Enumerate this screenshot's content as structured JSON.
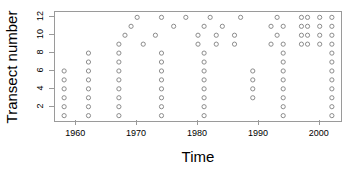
{
  "chart_data": {
    "type": "scatter",
    "title": "",
    "xlabel": "Time",
    "ylabel": "Transect number",
    "xlim": [
      1956.5,
      2003.5
    ],
    "ylim": [
      0.4,
      12.6
    ],
    "xticks": [
      1960,
      1970,
      1980,
      1990,
      2000
    ],
    "yticks": [
      2,
      4,
      6,
      8,
      10,
      12
    ],
    "grid": false,
    "legend": null,
    "marker": "open-circle",
    "marker_color": "#8c8c8c",
    "points": [
      {
        "x": 1958,
        "y": 1
      },
      {
        "x": 1958,
        "y": 2
      },
      {
        "x": 1958,
        "y": 3
      },
      {
        "x": 1958,
        "y": 4
      },
      {
        "x": 1958,
        "y": 5
      },
      {
        "x": 1958,
        "y": 6
      },
      {
        "x": 1962,
        "y": 1
      },
      {
        "x": 1962,
        "y": 2
      },
      {
        "x": 1962,
        "y": 3
      },
      {
        "x": 1962,
        "y": 4
      },
      {
        "x": 1962,
        "y": 5
      },
      {
        "x": 1962,
        "y": 6
      },
      {
        "x": 1962,
        "y": 7
      },
      {
        "x": 1962,
        "y": 8
      },
      {
        "x": 1967,
        "y": 1
      },
      {
        "x": 1967,
        "y": 2
      },
      {
        "x": 1967,
        "y": 3
      },
      {
        "x": 1967,
        "y": 4
      },
      {
        "x": 1967,
        "y": 5
      },
      {
        "x": 1967,
        "y": 6
      },
      {
        "x": 1967,
        "y": 7
      },
      {
        "x": 1967,
        "y": 8
      },
      {
        "x": 1967,
        "y": 9
      },
      {
        "x": 1968,
        "y": 10
      },
      {
        "x": 1969,
        "y": 11
      },
      {
        "x": 1970,
        "y": 12
      },
      {
        "x": 1971,
        "y": 9
      },
      {
        "x": 1973,
        "y": 10
      },
      {
        "x": 1974,
        "y": 1
      },
      {
        "x": 1974,
        "y": 2
      },
      {
        "x": 1974,
        "y": 3
      },
      {
        "x": 1974,
        "y": 4
      },
      {
        "x": 1974,
        "y": 5
      },
      {
        "x": 1974,
        "y": 6
      },
      {
        "x": 1974,
        "y": 7
      },
      {
        "x": 1974,
        "y": 8
      },
      {
        "x": 1974,
        "y": 12
      },
      {
        "x": 1976,
        "y": 11
      },
      {
        "x": 1978,
        "y": 12
      },
      {
        "x": 1980,
        "y": 9
      },
      {
        "x": 1980,
        "y": 10
      },
      {
        "x": 1981,
        "y": 1
      },
      {
        "x": 1981,
        "y": 2
      },
      {
        "x": 1981,
        "y": 3
      },
      {
        "x": 1981,
        "y": 4
      },
      {
        "x": 1981,
        "y": 5
      },
      {
        "x": 1981,
        "y": 6
      },
      {
        "x": 1981,
        "y": 7
      },
      {
        "x": 1981,
        "y": 8
      },
      {
        "x": 1981,
        "y": 11
      },
      {
        "x": 1982,
        "y": 12
      },
      {
        "x": 1983,
        "y": 9
      },
      {
        "x": 1983,
        "y": 10
      },
      {
        "x": 1984,
        "y": 11
      },
      {
        "x": 1986,
        "y": 9
      },
      {
        "x": 1986,
        "y": 10
      },
      {
        "x": 1987,
        "y": 12
      },
      {
        "x": 1989,
        "y": 3
      },
      {
        "x": 1989,
        "y": 4
      },
      {
        "x": 1989,
        "y": 5
      },
      {
        "x": 1989,
        "y": 6
      },
      {
        "x": 1992,
        "y": 9
      },
      {
        "x": 1992,
        "y": 11
      },
      {
        "x": 1993,
        "y": 10
      },
      {
        "x": 1993,
        "y": 12
      },
      {
        "x": 1994,
        "y": 1
      },
      {
        "x": 1994,
        "y": 2
      },
      {
        "x": 1994,
        "y": 3
      },
      {
        "x": 1994,
        "y": 4
      },
      {
        "x": 1994,
        "y": 5
      },
      {
        "x": 1994,
        "y": 6
      },
      {
        "x": 1994,
        "y": 7
      },
      {
        "x": 1994,
        "y": 8
      },
      {
        "x": 1994,
        "y": 9
      },
      {
        "x": 1994,
        "y": 11
      },
      {
        "x": 1997,
        "y": 9
      },
      {
        "x": 1997,
        "y": 10
      },
      {
        "x": 1997,
        "y": 11
      },
      {
        "x": 1997,
        "y": 12
      },
      {
        "x": 1998,
        "y": 9
      },
      {
        "x": 1998,
        "y": 10
      },
      {
        "x": 1998,
        "y": 11
      },
      {
        "x": 1998,
        "y": 12
      },
      {
        "x": 2000,
        "y": 9
      },
      {
        "x": 2000,
        "y": 10
      },
      {
        "x": 2000,
        "y": 11
      },
      {
        "x": 2000,
        "y": 12
      },
      {
        "x": 2002,
        "y": 1
      },
      {
        "x": 2002,
        "y": 2
      },
      {
        "x": 2002,
        "y": 3
      },
      {
        "x": 2002,
        "y": 4
      },
      {
        "x": 2002,
        "y": 5
      },
      {
        "x": 2002,
        "y": 6
      },
      {
        "x": 2002,
        "y": 7
      },
      {
        "x": 2002,
        "y": 8
      },
      {
        "x": 2002,
        "y": 9
      },
      {
        "x": 2002,
        "y": 10
      },
      {
        "x": 2002,
        "y": 11
      },
      {
        "x": 2002,
        "y": 12
      }
    ]
  }
}
